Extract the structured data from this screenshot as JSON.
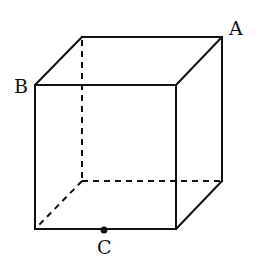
{
  "diagram": {
    "type": "cube",
    "labels": {
      "A": "A",
      "B": "B",
      "C": "C"
    },
    "points": [
      {
        "id": "A",
        "description": "back top-right vertex"
      },
      {
        "id": "B",
        "description": "front top-left vertex"
      },
      {
        "id": "C",
        "description": "point on front bottom edge",
        "marked": true
      }
    ],
    "stroke_color": "#111111"
  }
}
